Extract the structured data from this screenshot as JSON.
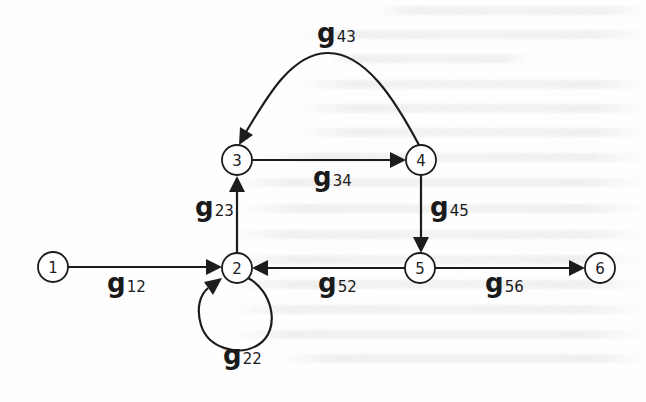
{
  "diagram": {
    "type": "signal-flow-graph",
    "colors": {
      "stroke": "#1c1c1c",
      "background": "#ffffff",
      "text": "#1a1a1a"
    },
    "nodes": [
      {
        "id": "1",
        "label": "1",
        "x": 53,
        "y": 267
      },
      {
        "id": "2",
        "label": "2",
        "x": 237,
        "y": 268
      },
      {
        "id": "3",
        "label": "3",
        "x": 237,
        "y": 160
      },
      {
        "id": "4",
        "label": "4",
        "x": 421,
        "y": 160
      },
      {
        "id": "5",
        "label": "5",
        "x": 420,
        "y": 268
      },
      {
        "id": "6",
        "label": "6",
        "x": 600,
        "y": 268
      }
    ],
    "edges": [
      {
        "from": "1",
        "to": "2",
        "gain": {
          "base": "g",
          "sub": "12"
        }
      },
      {
        "from": "2",
        "to": "3",
        "gain": {
          "base": "g",
          "sub": "23"
        }
      },
      {
        "from": "3",
        "to": "4",
        "gain": {
          "base": "g",
          "sub": "34"
        }
      },
      {
        "from": "4",
        "to": "3",
        "gain": {
          "base": "g",
          "sub": "43"
        }
      },
      {
        "from": "4",
        "to": "5",
        "gain": {
          "base": "g",
          "sub": "45"
        }
      },
      {
        "from": "5",
        "to": "2",
        "gain": {
          "base": "g",
          "sub": "52"
        }
      },
      {
        "from": "5",
        "to": "6",
        "gain": {
          "base": "g",
          "sub": "56"
        }
      },
      {
        "from": "2",
        "to": "2",
        "gain": {
          "base": "g",
          "sub": "22"
        }
      }
    ]
  }
}
